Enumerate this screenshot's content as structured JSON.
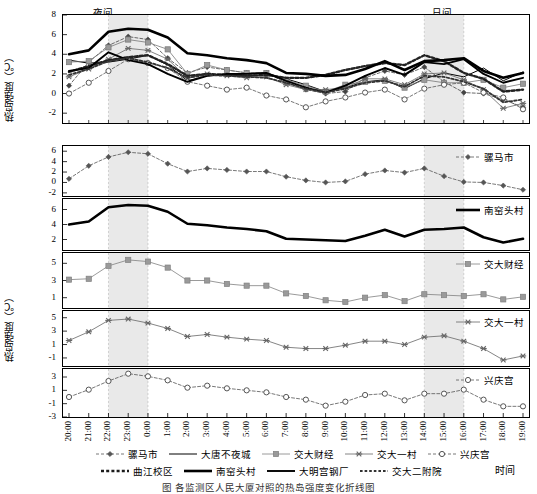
{
  "figure": {
    "yaxis_label": "热岛强度（℃）",
    "xaxis_label": "时间",
    "shade_night_label": "夜间",
    "shade_day_label": "日间",
    "caption": "图      各监测区人民大厦对照的热岛强度变化折线图"
  },
  "chart_data": {
    "type": "line",
    "title": "",
    "xlabel": "时间",
    "ylabel": "热岛强度（℃）",
    "grid": false,
    "legend_position": "bottom",
    "categories": [
      "20:00",
      "21:00",
      "22:00",
      "23:00",
      "0:00",
      "1:00",
      "2:00",
      "3:00",
      "4:00",
      "5:00",
      "6:00",
      "7:00",
      "8:00",
      "9:00",
      "10:00",
      "11:00",
      "12:00",
      "13:00",
      "14:00",
      "15:00",
      "16:00",
      "17:00",
      "18:00",
      "19:00"
    ],
    "shaded_regions": [
      {
        "label": "夜间",
        "from": "22:00",
        "to": "0:00"
      },
      {
        "label": "日间",
        "from": "14:00",
        "to": "16:00"
      }
    ],
    "panels": [
      {
        "name": "combined",
        "ylim": [
          -3,
          8
        ],
        "yticks": [
          8,
          6,
          4,
          2,
          0,
          -2
        ],
        "series": [
          {
            "name": "骡马市",
            "style": "dash-diamond",
            "color": "#444444",
            "values": [
              0.8,
              3.2,
              4.9,
              5.8,
              5.5,
              3.6,
              2.1,
              2.7,
              2.4,
              2.1,
              2.1,
              1.1,
              0.4,
              0.0,
              0.2,
              1.6,
              2.3,
              1.9,
              2.7,
              1.2,
              0.1,
              0.0,
              -0.6,
              -1.4
            ]
          },
          {
            "name": "大唐不夜城",
            "style": "solid-thin",
            "color": "#000000",
            "values": [
              3.4,
              3.1,
              3.2,
              3.5,
              3.9,
              2.9,
              1.3,
              1.8,
              1.9,
              2.0,
              2.1,
              1.5,
              0.9,
              0.2,
              0.6,
              1.2,
              1.4,
              0.5,
              1.5,
              2.1,
              1.7,
              2.6,
              1.3,
              2.2
            ]
          },
          {
            "name": "交大财经",
            "style": "square",
            "color": "#777777",
            "values": [
              3.2,
              3.3,
              4.7,
              5.5,
              5.2,
              4.5,
              2.0,
              2.9,
              2.4,
              2.1,
              2.1,
              1.4,
              0.8,
              0.2,
              0.9,
              1.2,
              1.3,
              0.6,
              1.4,
              1.1,
              1.1,
              1.4,
              0.6,
              1.0
            ]
          },
          {
            "name": "交大一村",
            "style": "star",
            "color": "#666666",
            "values": [
              1.7,
              2.5,
              3.5,
              4.6,
              4.4,
              3.5,
              1.6,
              2.0,
              1.8,
              1.6,
              1.7,
              0.9,
              0.4,
              0.4,
              0.6,
              1.5,
              1.5,
              0.9,
              2.0,
              2.1,
              1.4,
              0.4,
              -1.5,
              -1.0
            ]
          },
          {
            "name": "兴庆宫",
            "style": "dash-circle",
            "color": "#555555",
            "values": [
              0.0,
              1.1,
              2.3,
              3.5,
              3.1,
              2.6,
              1.2,
              0.8,
              0.4,
              0.6,
              -0.2,
              -0.6,
              -1.4,
              -0.8,
              -0.4,
              0.1,
              0.4,
              -0.6,
              0.5,
              0.9,
              1.1,
              0.1,
              -0.4,
              -1.6
            ]
          },
          {
            "name": "曲江校区",
            "style": "dotted-thick",
            "color": "#222222",
            "values": [
              2.2,
              2.8,
              3.4,
              3.7,
              3.9,
              3.0,
              1.8,
              2.0,
              1.9,
              1.8,
              1.9,
              1.6,
              1.6,
              1.9,
              2.4,
              2.8,
              3.1,
              2.9,
              3.9,
              3.3,
              2.1,
              1.5,
              0.2,
              0.4
            ]
          },
          {
            "name": "南窑头村",
            "style": "solid-bold",
            "color": "#000000",
            "values": [
              4.0,
              4.4,
              6.3,
              6.6,
              6.5,
              5.7,
              4.1,
              3.9,
              3.6,
              3.4,
              3.1,
              2.1,
              2.0,
              1.8,
              1.9,
              2.5,
              3.3,
              2.4,
              3.3,
              3.4,
              3.6,
              2.3,
              1.6,
              2.1
            ]
          },
          {
            "name": "大明宫钢厂",
            "style": "solid-medium",
            "color": "#000000",
            "values": [
              2.3,
              2.6,
              4.2,
              3.4,
              3.0,
              2.0,
              1.2,
              1.8,
              2.0,
              2.0,
              2.1,
              1.3,
              0.6,
              0.1,
              0.8,
              1.8,
              2.6,
              1.9,
              3.2,
              3.0,
              3.5,
              2.0,
              1.1,
              1.6
            ]
          },
          {
            "name": "交大二附院",
            "style": "dotted-med",
            "color": "#333333",
            "values": [
              1.9,
              2.5,
              3.3,
              3.6,
              3.2,
              2.6,
              1.6,
              1.9,
              1.8,
              1.7,
              1.6,
              1.1,
              0.5,
              0.1,
              0.5,
              1.1,
              1.3,
              0.7,
              1.8,
              1.7,
              1.2,
              0.5,
              -0.9,
              -0.6
            ]
          }
        ]
      },
      {
        "name": "骡马市",
        "legend": "骡马市",
        "style": "dash-diamond",
        "ylim": [
          -2.6,
          7
        ],
        "yticks": [
          6,
          4,
          2,
          0,
          -2
        ],
        "values": [
          0.7,
          3.2,
          4.9,
          5.8,
          5.5,
          3.6,
          2.1,
          2.7,
          2.4,
          2.1,
          2.1,
          1.1,
          0.4,
          0.0,
          0.2,
          1.6,
          2.3,
          1.9,
          2.7,
          1.2,
          0.1,
          0.0,
          -0.6,
          -1.4
        ]
      },
      {
        "name": "南窑头村",
        "legend": "南窑头村",
        "style": "solid-bold",
        "ylim": [
          0.6,
          7.4
        ],
        "yticks": [
          6,
          4,
          2
        ],
        "values": [
          4.0,
          4.4,
          6.3,
          6.6,
          6.5,
          5.7,
          4.1,
          3.9,
          3.6,
          3.4,
          3.1,
          2.1,
          2.0,
          1.9,
          1.8,
          2.5,
          3.3,
          2.4,
          3.3,
          3.4,
          3.6,
          2.3,
          1.6,
          2.1
        ]
      },
      {
        "name": "交大财经",
        "legend": "交大财经",
        "style": "square",
        "ylim": [
          -0.2,
          6.2
        ],
        "yticks": [
          5,
          3,
          1
        ],
        "values": [
          3.1,
          3.2,
          4.7,
          5.4,
          5.2,
          4.5,
          3.0,
          3.0,
          2.6,
          2.4,
          2.4,
          1.5,
          1.2,
          0.7,
          0.5,
          1.0,
          1.3,
          0.6,
          1.4,
          1.3,
          1.2,
          1.4,
          0.8,
          1.1
        ]
      },
      {
        "name": "交大一村",
        "legend": "交大一村",
        "style": "star",
        "ylim": [
          -2.2,
          6.0
        ],
        "yticks": [
          5,
          3,
          1,
          -1
        ],
        "values": [
          1.6,
          2.9,
          4.6,
          4.8,
          4.2,
          3.4,
          2.2,
          2.5,
          2.1,
          1.8,
          1.6,
          0.6,
          0.4,
          0.4,
          0.9,
          1.5,
          1.5,
          1.0,
          2.1,
          2.3,
          1.5,
          0.4,
          -1.3,
          -0.7
        ]
      },
      {
        "name": "兴庆宫",
        "legend": "兴庆宫",
        "style": "dash-circle",
        "ylim": [
          -3,
          4.2
        ],
        "yticks": [
          3,
          1,
          -1,
          -3
        ],
        "values": [
          0.0,
          1.1,
          2.4,
          3.5,
          3.1,
          2.5,
          1.4,
          1.7,
          1.3,
          1.0,
          0.7,
          0.0,
          -0.4,
          -1.3,
          -0.7,
          0.3,
          0.5,
          -0.5,
          0.5,
          0.5,
          1.1,
          -0.4,
          -1.4,
          -1.4
        ]
      }
    ],
    "legend_entries": [
      {
        "label": "骡马市",
        "style": "dash-diamond"
      },
      {
        "label": "大唐不夜城",
        "style": "solid-thin"
      },
      {
        "label": "交大财经",
        "style": "square"
      },
      {
        "label": "交大一村",
        "style": "star"
      },
      {
        "label": "兴庆宫",
        "style": "dash-circle"
      },
      {
        "label": "曲江校区",
        "style": "dotted-thick"
      },
      {
        "label": "南窑头村",
        "style": "solid-bold"
      },
      {
        "label": "大明宫钢厂",
        "style": "solid-medium"
      },
      {
        "label": "交大二附院",
        "style": "dotted-med"
      }
    ]
  }
}
